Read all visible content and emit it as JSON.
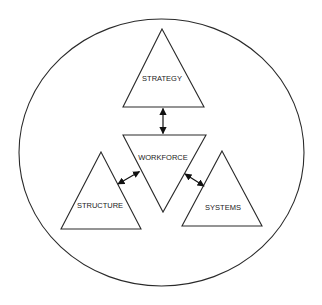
{
  "diagram": {
    "type": "organizational-model",
    "colors": {
      "stroke": "#2a2a2a",
      "background": "#ffffff",
      "text": "#222222"
    },
    "boundary": {
      "shape": "ellipse"
    },
    "nodes": [
      {
        "id": "strategy",
        "label": "STRATEGY",
        "shape": "triangle-up"
      },
      {
        "id": "workforce",
        "label": "WORKFORCE",
        "shape": "triangle-down"
      },
      {
        "id": "structure",
        "label": "STRUCTURE",
        "shape": "triangle-up"
      },
      {
        "id": "systems",
        "label": "SYSTEMS",
        "shape": "triangle-up"
      }
    ],
    "edges": [
      {
        "from": "strategy",
        "to": "workforce",
        "type": "bidirectional-arrow"
      },
      {
        "from": "structure",
        "to": "workforce",
        "type": "bidirectional-arrow"
      },
      {
        "from": "systems",
        "to": "workforce",
        "type": "bidirectional-arrow"
      }
    ]
  }
}
